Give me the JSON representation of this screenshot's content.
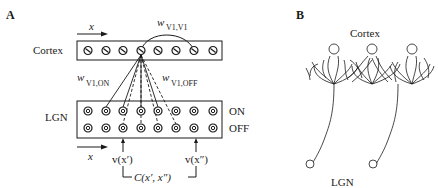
{
  "panel_a": {
    "label": "A",
    "cortex_label": "Cortex",
    "lgn_label": "LGN",
    "on_label": "ON",
    "off_label": "OFF",
    "x_axis_label": "x",
    "recurrent_weight": {
      "symbol": "w",
      "subscript": "V1,V1"
    },
    "ff_weight_on": {
      "symbol": "w",
      "subscript": "V1,ON"
    },
    "ff_weight_off": {
      "symbol": "w",
      "subscript": "V1,OFF"
    },
    "input_left": "v(x′)",
    "input_right": "v(x″)",
    "correlation": "C(x′, x″)",
    "cortex_units": 8,
    "lgn_units_per_row": 8
  },
  "panel_b": {
    "label": "B",
    "cortex_label": "Cortex",
    "lgn_label": "LGN"
  }
}
